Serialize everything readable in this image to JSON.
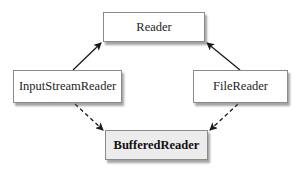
{
  "diagram": {
    "type": "class-hierarchy",
    "nodes": [
      {
        "id": "reader",
        "label": "Reader",
        "style": "normal"
      },
      {
        "id": "isr",
        "label": "InputStreamReader",
        "style": "normal"
      },
      {
        "id": "fr",
        "label": "FileReader",
        "style": "normal"
      },
      {
        "id": "br",
        "label": "BufferedReader",
        "style": "highlighted"
      }
    ],
    "edges": [
      {
        "from": "InputStreamReader",
        "to": "Reader",
        "line": "solid",
        "arrow": "filled"
      },
      {
        "from": "FileReader",
        "to": "Reader",
        "line": "solid",
        "arrow": "filled"
      },
      {
        "from": "InputStreamReader",
        "to": "BufferedReader",
        "line": "dashed",
        "arrow": "filled"
      },
      {
        "from": "FileReader",
        "to": "BufferedReader",
        "line": "dashed",
        "arrow": "filled"
      }
    ],
    "colors": {
      "line": "#1a1a1a",
      "box_border": "#8a8a8a",
      "highlight_fill": "#ececec"
    }
  }
}
